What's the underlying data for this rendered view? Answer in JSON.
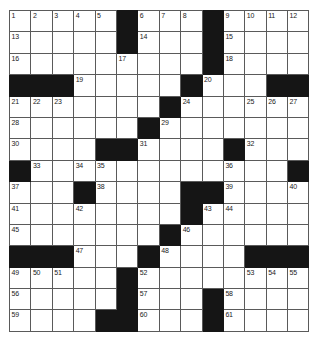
{
  "puzzle": {
    "type": "crossword-grid",
    "rows": 15,
    "cols": 14,
    "cell_size_px": 21.4,
    "colors": {
      "block": "#151515",
      "cell": "#ffffff",
      "border": "#5a5a5a",
      "number": "#1a1a1a",
      "page_background": "#ffffff"
    },
    "grid": [
      [
        "1",
        "2",
        "3",
        "4",
        "5",
        "#",
        "6",
        "7",
        "8",
        "#",
        "9",
        "10",
        "11",
        "12"
      ],
      [
        "13",
        "",
        "",
        "",
        "",
        "#",
        "14",
        "",
        "",
        "#",
        "15",
        "",
        "",
        ""
      ],
      [
        "16",
        "",
        "",
        "",
        "",
        "17",
        "",
        "",
        "",
        "#",
        "18",
        "",
        "",
        ""
      ],
      [
        "#",
        "#",
        "#",
        "19",
        "",
        "",
        "",
        "",
        "#",
        "20",
        "",
        "",
        "#",
        "#"
      ],
      [
        "21",
        "22",
        "23",
        "",
        "",
        "",
        "",
        "#",
        "24",
        "",
        "",
        "25",
        "26",
        "27"
      ],
      [
        "28",
        "",
        "",
        "",
        "",
        "",
        "#",
        "29",
        "",
        "",
        "",
        "",
        "",
        ""
      ],
      [
        "30",
        "",
        "",
        "",
        "#",
        "#",
        "31",
        "",
        "",
        "",
        "#",
        "32",
        "",
        ""
      ],
      [
        "#",
        "33",
        "",
        "34",
        "35",
        "",
        "",
        "",
        "",
        "",
        "36",
        "",
        "",
        "#"
      ],
      [
        "37",
        "",
        "",
        "#",
        "38",
        "",
        "",
        "",
        "#",
        "#",
        "39",
        "",
        "",
        "40"
      ],
      [
        "41",
        "",
        "",
        "42",
        "",
        "",
        "",
        "",
        "#",
        "43",
        "44",
        "",
        "",
        ""
      ],
      [
        "45",
        "",
        "",
        "",
        "",
        "",
        "",
        "#",
        "46",
        "",
        "",
        "",
        "",
        ""
      ],
      [
        "#",
        "#",
        "#",
        "47",
        "",
        "",
        "#",
        "48",
        "",
        "",
        "",
        "#",
        "#",
        "#"
      ],
      [
        "49",
        "50",
        "51",
        "",
        "",
        "#",
        "52",
        "",
        "",
        "",
        "",
        "53",
        "54",
        "55"
      ],
      [
        "56",
        "",
        "",
        "",
        "",
        "#",
        "57",
        "",
        "",
        "#",
        "58",
        "",
        "",
        ""
      ],
      [
        "59",
        "",
        "",
        "",
        "#",
        "#",
        "60",
        "",
        "",
        "#",
        "61",
        "",
        "",
        ""
      ]
    ],
    "numbered_cells": [
      {
        "n": "1",
        "row": 1,
        "col": 1
      },
      {
        "n": "2",
        "row": 1,
        "col": 2
      },
      {
        "n": "3",
        "row": 1,
        "col": 3
      },
      {
        "n": "4",
        "row": 1,
        "col": 4
      },
      {
        "n": "5",
        "row": 1,
        "col": 5
      },
      {
        "n": "6",
        "row": 1,
        "col": 7
      },
      {
        "n": "7",
        "row": 1,
        "col": 8
      },
      {
        "n": "8",
        "row": 1,
        "col": 9
      },
      {
        "n": "9",
        "row": 1,
        "col": 11
      },
      {
        "n": "10",
        "row": 1,
        "col": 12
      },
      {
        "n": "11",
        "row": 1,
        "col": 13
      },
      {
        "n": "12",
        "row": 1,
        "col": 14
      },
      {
        "n": "13",
        "row": 2,
        "col": 1
      },
      {
        "n": "14",
        "row": 2,
        "col": 7
      },
      {
        "n": "15",
        "row": 2,
        "col": 11
      },
      {
        "n": "16",
        "row": 3,
        "col": 1
      },
      {
        "n": "17",
        "row": 3,
        "col": 6
      },
      {
        "n": "18",
        "row": 3,
        "col": 11
      },
      {
        "n": "19",
        "row": 4,
        "col": 4
      },
      {
        "n": "20",
        "row": 4,
        "col": 10
      },
      {
        "n": "21",
        "row": 5,
        "col": 1
      },
      {
        "n": "22",
        "row": 5,
        "col": 2
      },
      {
        "n": "23",
        "row": 5,
        "col": 3
      },
      {
        "n": "24",
        "row": 5,
        "col": 9
      },
      {
        "n": "25",
        "row": 5,
        "col": 12
      },
      {
        "n": "26",
        "row": 5,
        "col": 13
      },
      {
        "n": "27",
        "row": 5,
        "col": 14
      },
      {
        "n": "28",
        "row": 6,
        "col": 1
      },
      {
        "n": "29",
        "row": 6,
        "col": 8
      },
      {
        "n": "30",
        "row": 7,
        "col": 1
      },
      {
        "n": "31",
        "row": 7,
        "col": 7
      },
      {
        "n": "32",
        "row": 7,
        "col": 12
      },
      {
        "n": "33",
        "row": 8,
        "col": 2
      },
      {
        "n": "34",
        "row": 8,
        "col": 4
      },
      {
        "n": "35",
        "row": 8,
        "col": 5
      },
      {
        "n": "36",
        "row": 8,
        "col": 11
      },
      {
        "n": "37",
        "row": 9,
        "col": 1
      },
      {
        "n": "38",
        "row": 9,
        "col": 5
      },
      {
        "n": "39",
        "row": 9,
        "col": 11
      },
      {
        "n": "40",
        "row": 9,
        "col": 14
      },
      {
        "n": "41",
        "row": 10,
        "col": 1
      },
      {
        "n": "42",
        "row": 10,
        "col": 4
      },
      {
        "n": "43",
        "row": 10,
        "col": 10
      },
      {
        "n": "44",
        "row": 10,
        "col": 11
      },
      {
        "n": "45",
        "row": 11,
        "col": 1
      },
      {
        "n": "46",
        "row": 11,
        "col": 9
      },
      {
        "n": "47",
        "row": 12,
        "col": 4
      },
      {
        "n": "48",
        "row": 12,
        "col": 8
      },
      {
        "n": "49",
        "row": 13,
        "col": 1
      },
      {
        "n": "50",
        "row": 13,
        "col": 2
      },
      {
        "n": "51",
        "row": 13,
        "col": 3
      },
      {
        "n": "52",
        "row": 13,
        "col": 7
      },
      {
        "n": "53",
        "row": 13,
        "col": 12
      },
      {
        "n": "54",
        "row": 13,
        "col": 13
      },
      {
        "n": "55",
        "row": 13,
        "col": 14
      },
      {
        "n": "56",
        "row": 14,
        "col": 1
      },
      {
        "n": "57",
        "row": 14,
        "col": 7
      },
      {
        "n": "58",
        "row": 14,
        "col": 11
      },
      {
        "n": "59",
        "row": 15,
        "col": 1
      },
      {
        "n": "60",
        "row": 15,
        "col": 7
      },
      {
        "n": "61",
        "row": 15,
        "col": 11
      }
    ]
  }
}
